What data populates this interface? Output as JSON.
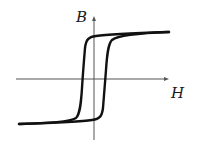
{
  "diagram": {
    "type": "hysteresis-loop",
    "axes": {
      "vertical": {
        "label": "B"
      },
      "horizontal": {
        "label": "H"
      }
    },
    "colors": {
      "curve": "#111111",
      "axis": "#555555",
      "background": "#ffffff"
    },
    "curve": {
      "description": "B-H magnetic hysteresis loop with saturation plateaus",
      "upper_branch_crosses_H_axis_at": "negative coercivity",
      "lower_branch_crosses_H_axis_at": "positive coercivity"
    }
  }
}
